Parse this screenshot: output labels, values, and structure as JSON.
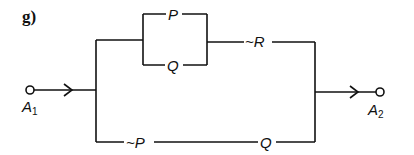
{
  "figure": {
    "tag": "g)",
    "input_terminal": {
      "label": "A",
      "subscript": "1"
    },
    "output_terminal": {
      "label": "A",
      "subscript": "2"
    },
    "upper_path": {
      "parallel_block": {
        "top": "P",
        "bottom": "Q"
      },
      "series": "~R"
    },
    "lower_path": {
      "first": "~P",
      "second": "Q"
    }
  }
}
